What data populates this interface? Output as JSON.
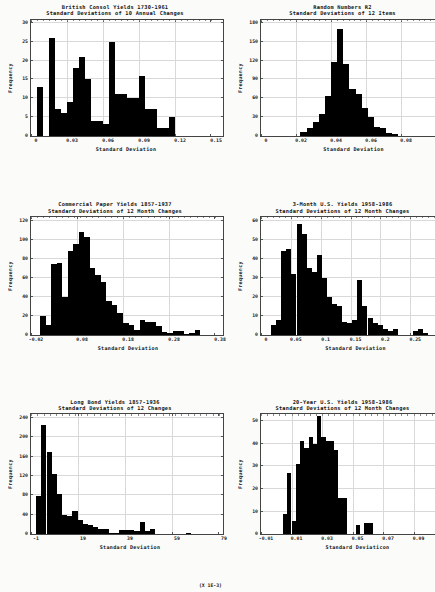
{
  "chart_data": [
    {
      "type": "bar",
      "title": "British Consol Yields 1730-1961",
      "subtitle": "Standard Deviations of 10 Annual Changes",
      "xlabel": "Standard Deviation",
      "ylabel": "Frequency",
      "xticks": [
        "0",
        "0.03",
        "0.06",
        "0.09",
        "0.12",
        "0.15"
      ],
      "xtickvals": [
        0,
        0.03,
        0.06,
        0.09,
        0.12,
        0.15
      ],
      "yticks": [
        "0",
        "5",
        "10",
        "15",
        "20",
        "25",
        "30"
      ],
      "ytickvals": [
        0,
        5,
        10,
        15,
        20,
        25,
        30
      ],
      "xlim": [
        0,
        0.15
      ],
      "ylim": [
        0,
        31
      ],
      "binwidth": 0.005,
      "bins": [
        0.005,
        0.01,
        0.015,
        0.02,
        0.025,
        0.03,
        0.035,
        0.04,
        0.045,
        0.05,
        0.055,
        0.06,
        0.065,
        0.07,
        0.075,
        0.08,
        0.085,
        0.09,
        0.095,
        0.1,
        0.105,
        0.11,
        0.115,
        0.12
      ],
      "values": [
        13,
        0,
        26,
        7,
        6,
        9,
        18,
        21,
        15,
        4,
        4,
        3,
        25,
        11,
        11,
        10,
        10,
        16,
        7,
        7,
        2,
        2,
        5,
        0
      ],
      "grid": true,
      "legend": false
    },
    {
      "type": "bar",
      "title": "Random Numbers R2",
      "subtitle": "Standard Deviations of 12 Items",
      "xlabel": "Standard Deviation",
      "ylabel": "Frequency",
      "xticks": [
        "0",
        "0.02",
        "0.04",
        "0.06",
        "0.08",
        "0.1"
      ],
      "xtickvals": [
        0,
        0.02,
        0.04,
        0.06,
        0.08,
        0.1
      ],
      "yticks": [
        "0",
        "30",
        "60",
        "90",
        "120",
        "150",
        "180"
      ],
      "ytickvals": [
        0,
        30,
        60,
        90,
        120,
        150,
        180
      ],
      "xlim": [
        0,
        0.1
      ],
      "ylim": [
        0,
        186
      ],
      "binwidth": 0.0035,
      "bins": [
        0.0225,
        0.026,
        0.0295,
        0.033,
        0.0365,
        0.04,
        0.0435,
        0.047,
        0.0505,
        0.054,
        0.0575,
        0.061,
        0.0645,
        0.068,
        0.0715,
        0.075
      ],
      "values": [
        5,
        12,
        22,
        34,
        63,
        118,
        170,
        115,
        75,
        67,
        44,
        29,
        14,
        12,
        4,
        2
      ],
      "grid": true,
      "legend": false
    },
    {
      "type": "bar",
      "title": "Commercial Paper Yields 1857-1937",
      "subtitle": "Standard Deviations of 12 Month Changes",
      "xlabel": "Standard Deviation",
      "ylabel": "Frequency",
      "xticks": [
        "-0.02",
        "0.08",
        "0.18",
        "0.28",
        "0.38"
      ],
      "xtickvals": [
        -0.02,
        0.08,
        0.18,
        0.28,
        0.38
      ],
      "yticks": [
        "0",
        "20",
        "40",
        "60",
        "80",
        "100",
        "120"
      ],
      "ytickvals": [
        0,
        20,
        40,
        60,
        80,
        100,
        120
      ],
      "xlim": [
        -0.02,
        0.38
      ],
      "ylim": [
        0,
        124
      ],
      "binwidth": 0.012,
      "bins": [
        0.0,
        0.012,
        0.024,
        0.036,
        0.048,
        0.06,
        0.072,
        0.084,
        0.096,
        0.108,
        0.12,
        0.132,
        0.144,
        0.156,
        0.168,
        0.18,
        0.192,
        0.204,
        0.216,
        0.228,
        0.24,
        0.252,
        0.264,
        0.276,
        0.288,
        0.3,
        0.312,
        0.324,
        0.336
      ],
      "values": [
        20,
        10,
        74,
        75,
        40,
        88,
        95,
        108,
        103,
        70,
        63,
        56,
        36,
        31,
        23,
        12,
        10,
        5,
        16,
        14,
        13,
        9,
        3,
        2,
        4,
        4,
        1,
        2,
        5
      ],
      "grid": true,
      "legend": false
    },
    {
      "type": "bar",
      "title": "3-Month U.S. Yields 1958-1986",
      "subtitle": "Standard Deviations of 12 Month Changes",
      "xlabel": "Standard Deviation",
      "ylabel": "Frequency",
      "xticks": [
        "0",
        "0.05",
        "0.1",
        "0.15",
        "0.2",
        "0.25",
        "0.3"
      ],
      "xtickvals": [
        0,
        0.05,
        0.1,
        0.15,
        0.2,
        0.25,
        0.3
      ],
      "yticks": [
        "0",
        "10",
        "20",
        "30",
        "40",
        "50",
        "60"
      ],
      "ytickvals": [
        0,
        10,
        20,
        30,
        40,
        50,
        60
      ],
      "xlim": [
        0,
        0.3
      ],
      "ylim": [
        0,
        62
      ],
      "binwidth": 0.0085,
      "bins": [
        0.017,
        0.0255,
        0.034,
        0.0425,
        0.051,
        0.0595,
        0.068,
        0.0765,
        0.085,
        0.0935,
        0.102,
        0.1105,
        0.119,
        0.1275,
        0.136,
        0.1445,
        0.153,
        0.1615,
        0.17,
        0.1785,
        0.187,
        0.1955,
        0.204,
        0.2125,
        0.221,
        0.2295,
        0.238,
        0.2465,
        0.255,
        0.2635,
        0.272
      ],
      "values": [
        5,
        8,
        44,
        45,
        32,
        58,
        53,
        35,
        33,
        42,
        30,
        20,
        16,
        15,
        7,
        6,
        8,
        29,
        15,
        9,
        6,
        5,
        3,
        2,
        3,
        0,
        0,
        0,
        2,
        3,
        1
      ],
      "grid": true,
      "legend": false
    },
    {
      "type": "bar",
      "title": "Long Bond Yields 1857-1936",
      "subtitle": "Standard Deviations of 12 Changes",
      "xlabel": "Standard Deviation",
      "ylabel": "Frequency",
      "xnote": "(X 1E-3)",
      "xticks": [
        "-1",
        "19",
        "39",
        "59",
        "79"
      ],
      "xtickvals": [
        -1,
        19,
        39,
        59,
        79
      ],
      "yticks": [
        "0",
        "40",
        "80",
        "120",
        "160",
        "200",
        "240"
      ],
      "ytickvals": [
        0,
        40,
        80,
        120,
        160,
        200,
        240
      ],
      "xlim": [
        -1,
        79
      ],
      "ylim": [
        0,
        248
      ],
      "binwidth": 2.2,
      "bins": [
        1.2,
        3.4,
        5.6,
        7.8,
        10.0,
        12.2,
        14.4,
        16.6,
        18.8,
        21.0,
        23.2,
        25.4,
        27.6,
        29.8,
        32.0,
        34.2,
        36.4,
        38.6,
        40.8,
        43.0,
        45.2,
        47.4,
        49.6,
        51.8,
        54.0,
        56.2,
        58.4,
        60.6,
        62.8,
        65.0,
        67.2
      ],
      "values": [
        78,
        225,
        170,
        125,
        82,
        40,
        38,
        48,
        30,
        22,
        18,
        14,
        10,
        10,
        3,
        3,
        8,
        8,
        9,
        7,
        26,
        6,
        11,
        0,
        0,
        0,
        1,
        1,
        0,
        2,
        1
      ],
      "grid": true,
      "legend": false
    },
    {
      "type": "bar",
      "title": "20-Year U.S. Yields 1958-1986",
      "subtitle": "Standard Deviations of 12 Month Changes",
      "xlabel": "Standard Deviaticon",
      "ylabel": "Frequency",
      "xticks": [
        "-0.01",
        "0.01",
        "0.03",
        "0.05",
        "0.07",
        "0.09",
        "0.11"
      ],
      "xtickvals": [
        -0.01,
        0.01,
        0.03,
        0.05,
        0.07,
        0.09,
        0.11
      ],
      "yticks": [
        "0",
        "10",
        "20",
        "30",
        "40",
        "50"
      ],
      "ytickvals": [
        0,
        10,
        20,
        30,
        40,
        50
      ],
      "xlim": [
        -0.01,
        0.11
      ],
      "ylim": [
        0,
        53
      ],
      "binwidth": 0.0028,
      "bins": [
        0.0044,
        0.0072,
        0.01,
        0.0128,
        0.0156,
        0.0184,
        0.0212,
        0.024,
        0.0268,
        0.0296,
        0.0324,
        0.0352,
        0.038,
        0.0408,
        0.0436,
        0.0464,
        0.0492,
        0.052,
        0.0548,
        0.0576,
        0.0604,
        0.0632,
        0.066,
        0.0688
      ],
      "values": [
        9,
        27,
        6,
        31,
        41,
        38,
        43,
        40,
        52,
        43,
        41,
        41,
        37,
        16,
        16,
        0,
        0,
        4,
        0,
        5,
        5,
        0,
        0,
        0
      ],
      "grid": true,
      "legend": false
    }
  ]
}
